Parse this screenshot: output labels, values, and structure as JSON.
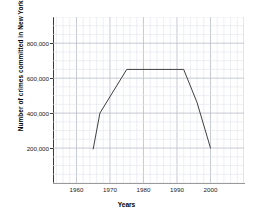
{
  "chart_data": {
    "type": "line",
    "title": "",
    "xlabel": "Years",
    "ylabel": "Number of crimes committed in New York City",
    "xlim": [
      1953,
      2010
    ],
    "ylim": [
      0,
      950000
    ],
    "grid": true,
    "minor_grid": true,
    "legend": "none",
    "line_color": "#404040",
    "grid_color": "#b8bcc8",
    "minor_grid_color": "#e2e4ec",
    "axis_color": "#3a3a3a",
    "x_ticks": [
      1960,
      1970,
      1980,
      1990,
      2000
    ],
    "x_tick_labels": [
      "1960",
      "1970",
      "1980",
      "1990",
      "2000"
    ],
    "y_ticks": [
      200000,
      400000,
      600000,
      800000
    ],
    "y_tick_labels": [
      "200,000",
      "400,000",
      "600,000",
      "800,000"
    ],
    "series": [
      {
        "name": "Crimes committed",
        "x": [
          1965,
          1967,
          1975,
          1992,
          1996,
          2000
        ],
        "values": [
          195000,
          400000,
          650000,
          650000,
          460000,
          200000
        ]
      }
    ]
  }
}
